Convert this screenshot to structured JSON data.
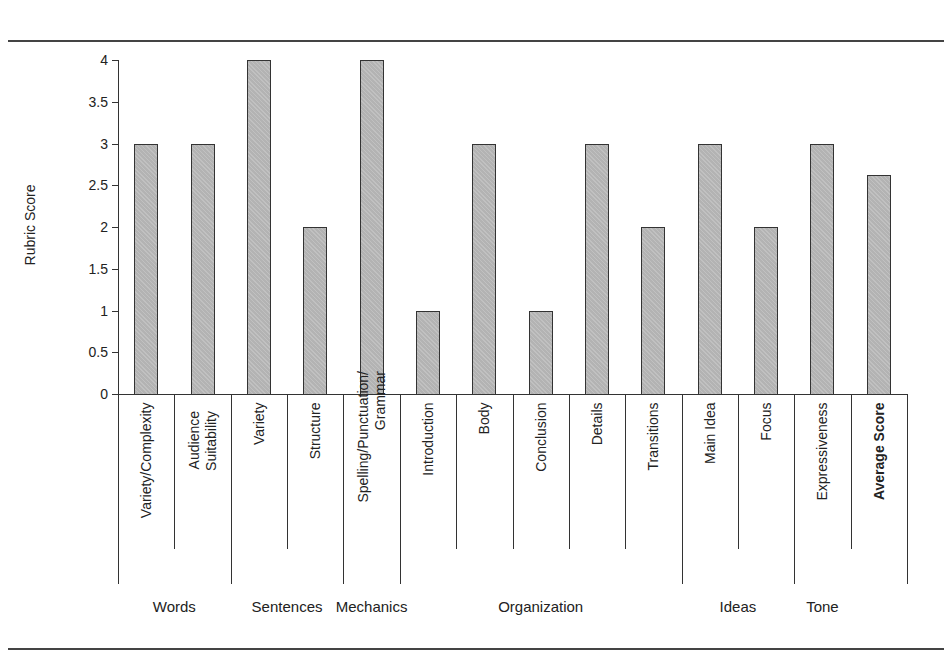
{
  "caption": "Figure",
  "chart_data": {
    "type": "bar",
    "title": "",
    "xlabel": "",
    "ylabel": "Rubric Score",
    "ylim": [
      0,
      4
    ],
    "yticks": [
      "0",
      "0.5",
      "1",
      "1.5",
      "2",
      "2.5",
      "3",
      "3.5",
      "4"
    ],
    "grid": false,
    "legend": null,
    "bar_color": "#b3b3b3",
    "categories": [
      {
        "label": "Variety/Complexity",
        "group": "Words",
        "value": 3
      },
      {
        "label": "Audience Suitability",
        "group": "Words",
        "value": 3
      },
      {
        "label": "Variety",
        "group": "Sentences",
        "value": 4
      },
      {
        "label": "Structure",
        "group": "Sentences",
        "value": 2
      },
      {
        "label": "Spelling/Punctuation/ Grammar",
        "group": "Mechanics",
        "value": 4
      },
      {
        "label": "Introduction",
        "group": "Organization",
        "value": 1
      },
      {
        "label": "Body",
        "group": "Organization",
        "value": 3
      },
      {
        "label": "Conclusion",
        "group": "Organization",
        "value": 1
      },
      {
        "label": "Details",
        "group": "Organization",
        "value": 3
      },
      {
        "label": "Transitions",
        "group": "Organization",
        "value": 2
      },
      {
        "label": "Main Idea",
        "group": "Ideas",
        "value": 3
      },
      {
        "label": "Focus",
        "group": "Ideas",
        "value": 2
      },
      {
        "label": "Expressiveness",
        "group": "Tone",
        "value": 3
      },
      {
        "label": "Average Score",
        "group": "",
        "value": 2.62,
        "bold": true
      }
    ],
    "groups": [
      "Words",
      "Sentences",
      "Mechanics",
      "Organization",
      "Ideas",
      "Tone"
    ]
  }
}
